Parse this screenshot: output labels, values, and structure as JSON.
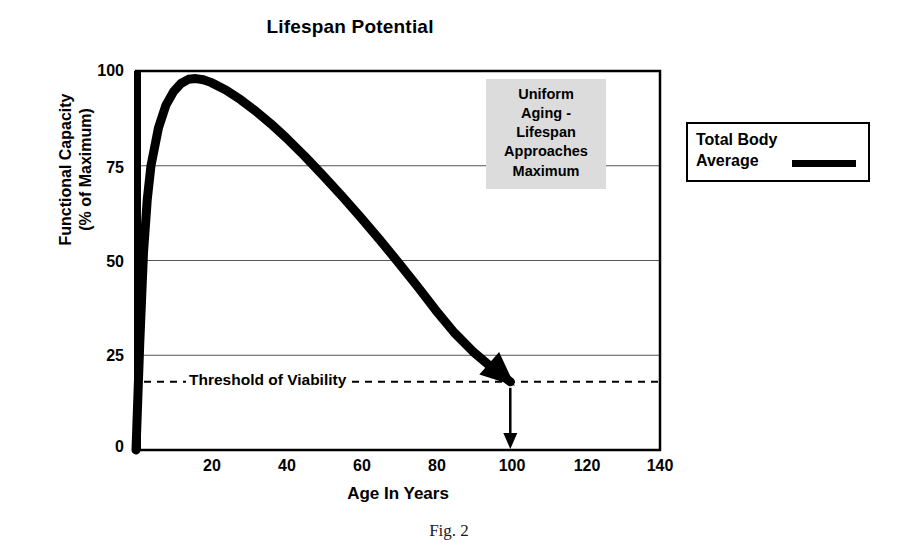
{
  "figure": {
    "caption": "Fig. 2"
  },
  "chart_data": {
    "type": "line",
    "title": "Lifespan Potential",
    "xlabel": "Age In Years",
    "ylabel": "Functional Capacity\n(% of Maximum)",
    "xlim": [
      0,
      140
    ],
    "ylim": [
      0,
      100
    ],
    "grid": true,
    "xticks": [
      20,
      40,
      60,
      80,
      100,
      120,
      140
    ],
    "yticks": [
      0,
      25,
      50,
      75,
      100
    ],
    "series": [
      {
        "name": "Total Body Average",
        "color": "#000000",
        "x": [
          0,
          1,
          2,
          3,
          4,
          6,
          8,
          10,
          12,
          14,
          16,
          18,
          20,
          24,
          28,
          32,
          36,
          40,
          45,
          50,
          55,
          60,
          65,
          70,
          75,
          80,
          85,
          90,
          95,
          100
        ],
        "y": [
          0,
          28,
          52,
          66,
          75,
          85,
          91,
          94.5,
          96.7,
          97.8,
          98,
          97.7,
          97,
          95,
          92.4,
          89.4,
          86.1,
          82.5,
          77.6,
          72.4,
          67,
          61.4,
          55.6,
          49.6,
          43.4,
          37,
          31,
          26,
          21.8,
          18
        ]
      }
    ],
    "threshold": {
      "label": "Threshold of Viability",
      "value": 18,
      "style": "dashed"
    },
    "annotations": [
      {
        "name": "uniform-aging-note",
        "text": "Uniform\nAging -\nLifespan\nApproaches\nMaximum",
        "background": "#dcdcdc",
        "x": 100,
        "y": 82
      },
      {
        "name": "lifespan-endpoint-arrow",
        "text": "",
        "x": 100,
        "y_from": 18,
        "y_to": 0
      }
    ],
    "legend": {
      "position": "right",
      "entries": [
        {
          "label": "Total Body\nAverage",
          "color": "#000000"
        }
      ]
    }
  }
}
